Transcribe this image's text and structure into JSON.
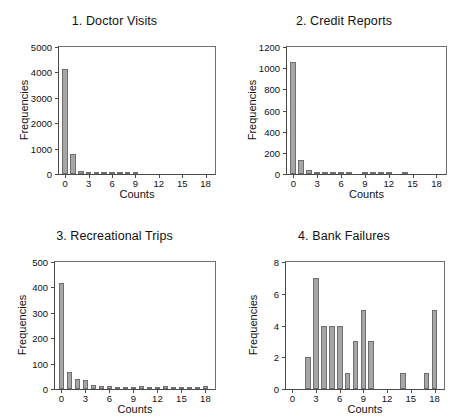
{
  "figure": {
    "background": "#ffffff",
    "bar_fill": "#a6a6a6",
    "bar_edge": "#6e6e6e",
    "axis_color": "#4a4a4a",
    "text_color": "#111111"
  },
  "chart_data": [
    {
      "type": "bar",
      "panel": 1,
      "title": "1. Doctor Visits",
      "xlabel": "Counts",
      "ylabel": "Frequencies",
      "grid": false,
      "legend": null,
      "xlim": [
        -0.8,
        19.2
      ],
      "ylim": [
        0,
        5000
      ],
      "xticks": [
        0,
        3,
        6,
        9,
        12,
        15,
        18
      ],
      "xtick_labels": [
        "0",
        "3",
        "6",
        "9",
        "12",
        "15",
        "18"
      ],
      "yticks": [
        0,
        1000,
        2000,
        3000,
        4000,
        5000
      ],
      "ytick_labels": [
        "0",
        "1000",
        "2000",
        "3000",
        "4000",
        "5000"
      ],
      "categories": [
        0,
        1,
        2,
        3,
        4,
        5,
        6,
        7,
        8,
        9
      ],
      "values": [
        4120,
        780,
        130,
        45,
        30,
        25,
        20,
        15,
        12,
        8
      ]
    },
    {
      "type": "bar",
      "panel": 2,
      "title": "2. Credit Reports",
      "xlabel": "Counts",
      "ylabel": "Frequencies",
      "grid": false,
      "legend": null,
      "xlim": [
        -0.8,
        19.2
      ],
      "ylim": [
        0,
        1200
      ],
      "xticks": [
        0,
        3,
        6,
        9,
        12,
        15,
        18
      ],
      "xtick_labels": [
        "0",
        "3",
        "6",
        "9",
        "12",
        "15",
        "18"
      ],
      "yticks": [
        0,
        200,
        400,
        600,
        800,
        1000,
        1200
      ],
      "ytick_labels": [
        "0",
        "200",
        "400",
        "600",
        "800",
        "1000",
        "1200"
      ],
      "categories": [
        0,
        1,
        2,
        3,
        4,
        5,
        6,
        7,
        9,
        10,
        11,
        12,
        14
      ],
      "values": [
        1055,
        135,
        35,
        18,
        14,
        12,
        10,
        8,
        7,
        7,
        6,
        5,
        5
      ]
    },
    {
      "type": "bar",
      "panel": 3,
      "title": "3. Recreational Trips",
      "xlabel": "Counts",
      "ylabel": "Frequencies",
      "grid": false,
      "legend": null,
      "xlim": [
        -0.8,
        19.2
      ],
      "ylim": [
        0,
        500
      ],
      "xticks": [
        0,
        3,
        6,
        9,
        12,
        15,
        18
      ],
      "xtick_labels": [
        "0",
        "3",
        "6",
        "9",
        "12",
        "15",
        "18"
      ],
      "yticks": [
        0,
        100,
        200,
        300,
        400,
        500
      ],
      "ytick_labels": [
        "0",
        "100",
        "200",
        "300",
        "400",
        "500"
      ],
      "categories": [
        0,
        1,
        2,
        3,
        4,
        5,
        6,
        7,
        8,
        9,
        10,
        11,
        12,
        13,
        14,
        15,
        16,
        17,
        18
      ],
      "values": [
        417,
        68,
        38,
        34,
        17,
        13,
        13,
        8,
        8,
        7,
        13,
        8,
        8,
        13,
        7,
        6,
        6,
        6,
        10
      ]
    },
    {
      "type": "bar",
      "panel": 4,
      "title": "4. Bank Failures",
      "xlabel": "Counts",
      "ylabel": "Frequencies",
      "grid": false,
      "legend": null,
      "xlim": [
        -0.8,
        19.2
      ],
      "ylim": [
        0,
        8
      ],
      "xticks": [
        0,
        3,
        6,
        9,
        12,
        15,
        18
      ],
      "xtick_labels": [
        "0",
        "3",
        "6",
        "9",
        "12",
        "15",
        "18"
      ],
      "yticks": [
        0,
        2,
        4,
        6,
        8
      ],
      "ytick_labels": [
        "0",
        "2",
        "4",
        "6",
        "8"
      ],
      "categories": [
        2,
        3,
        4,
        5,
        6,
        7,
        8,
        9,
        10,
        14,
        17,
        18
      ],
      "values": [
        2,
        7,
        4,
        4,
        4,
        1,
        3,
        5,
        3,
        1,
        1,
        5
      ]
    }
  ]
}
